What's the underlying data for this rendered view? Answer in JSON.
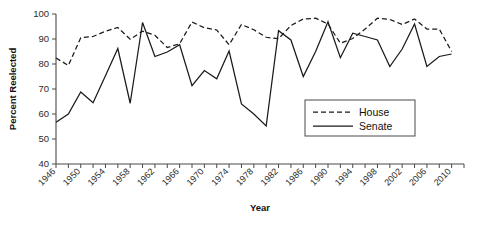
{
  "chart_data": {
    "type": "line",
    "title": "",
    "xlabel": "Year",
    "ylabel": "Percent Reelected",
    "ylim": [
      40,
      100
    ],
    "ytick_step": 10,
    "yticks": [
      40,
      50,
      60,
      70,
      80,
      90,
      100
    ],
    "xlim": [
      1946,
      2012
    ],
    "grid": false,
    "legend_position": "inside-right",
    "x": [
      1946,
      1948,
      1950,
      1952,
      1954,
      1956,
      1958,
      1960,
      1962,
      1964,
      1966,
      1968,
      1970,
      1972,
      1974,
      1976,
      1978,
      1980,
      1982,
      1984,
      1986,
      1988,
      1990,
      1992,
      1994,
      1996,
      1998,
      2000,
      2002,
      2004,
      2006,
      2008,
      2010
    ],
    "xtick_labels": [
      "1946",
      "1950",
      "1954",
      "1958",
      "1962",
      "1966",
      "1970",
      "1974",
      "1978",
      "1982",
      "1986",
      "1990",
      "1994",
      "1998",
      "2002",
      "2006",
      "2010"
    ],
    "xtick_label_values": [
      1946,
      1950,
      1954,
      1958,
      1962,
      1966,
      1970,
      1974,
      1978,
      1982,
      1986,
      1990,
      1994,
      1998,
      2002,
      2006,
      2010
    ],
    "series": [
      {
        "name": "House",
        "style": "dashed",
        "color": "#1a1a1a",
        "values": [
          82.4,
          79.4,
          90.5,
          91.0,
          93.1,
          94.6,
          89.9,
          93.1,
          91.5,
          86.6,
          88.1,
          96.8,
          94.5,
          93.6,
          87.7,
          95.8,
          93.7,
          90.7,
          90.1,
          95.4,
          98.0,
          98.3,
          96.0,
          88.3,
          90.2,
          94.0,
          98.3,
          97.8,
          95.8,
          98.0,
          94.0,
          94.0,
          85.0
        ]
      },
      {
        "name": "Senate",
        "style": "solid",
        "color": "#1a1a1a",
        "values": [
          56.7,
          60.0,
          68.8,
          64.5,
          75.3,
          86.2,
          64.3,
          96.6,
          83.0,
          84.8,
          87.7,
          71.3,
          77.4,
          74.1,
          85.2,
          64.0,
          60.0,
          55.2,
          93.3,
          89.6,
          75.0,
          85.0,
          96.9,
          82.5,
          92.3,
          91.0,
          89.6,
          79.0,
          86.0,
          96.0,
          79.0,
          83.0,
          84.0
        ]
      }
    ]
  },
  "legend": {
    "entries": [
      {
        "label": "House",
        "style": "dashed"
      },
      {
        "label": "Senate",
        "style": "solid"
      }
    ]
  },
  "axes": {
    "y_title": "Percent Reelected",
    "x_title": "Year"
  }
}
